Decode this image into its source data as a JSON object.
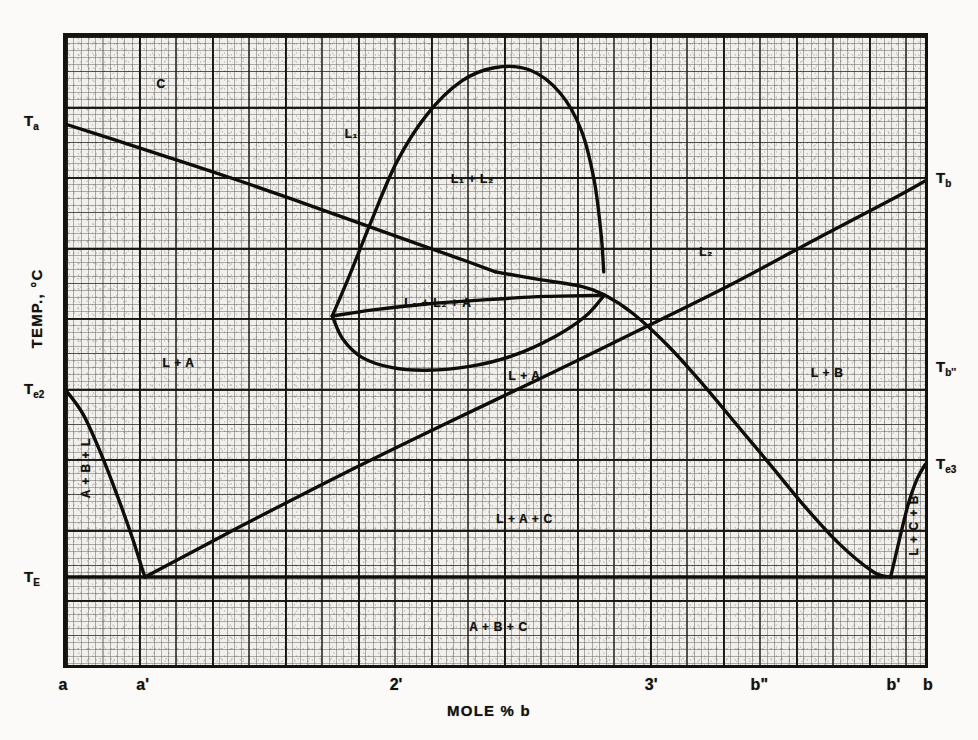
{
  "figure": {
    "kind": "ternary-quasi-binary-phase-diagram",
    "xaxis_title": "MOLE % b",
    "yaxis_title": "TEMP., °C"
  },
  "chart_data": {
    "type": "line",
    "title": "",
    "xlabel": "MOLE % b",
    "ylabel": "TEMP., °C",
    "xlim": [
      0,
      100
    ],
    "ylim": [
      0,
      100
    ],
    "grid": true,
    "legend": "none",
    "x_ticks": [
      {
        "label": "a",
        "x": 0
      },
      {
        "label": "a'",
        "x": 9.2
      },
      {
        "label": "2'",
        "x": 38.5
      },
      {
        "label": "3'",
        "x": 68.0
      },
      {
        "label": "b\"",
        "x": 80.5
      },
      {
        "label": "b'",
        "x": 96.0
      },
      {
        "label": "b",
        "x": 100
      }
    ],
    "y_ticks": [
      {
        "label": "T",
        "sub": "a",
        "y": 86.0,
        "side": "left"
      },
      {
        "label": "T",
        "sub": "e2",
        "y": 43.8,
        "side": "left"
      },
      {
        "label": "T",
        "sub": "E",
        "y": 14.2,
        "side": "left"
      },
      {
        "label": "T",
        "sub": "b",
        "y": 77.0,
        "side": "right"
      },
      {
        "label": "T",
        "sub": "b''",
        "y": 47.3,
        "side": "right"
      },
      {
        "label": "T",
        "sub": "e3",
        "y": 32.0,
        "side": "right"
      }
    ],
    "series": [
      {
        "name": "a-liquidus (A saturation, falling from Ta)",
        "points": [
          [
            0,
            86.0
          ],
          [
            8,
            82.5
          ],
          [
            17,
            78.5
          ],
          [
            26,
            74.3
          ],
          [
            34,
            70.4
          ],
          [
            41,
            67.0
          ],
          [
            46,
            64.6
          ],
          [
            50,
            62.6
          ]
        ]
      },
      {
        "name": "miscibility-gap dome (L1 + L2)",
        "points": [
          [
            31,
            55.6
          ],
          [
            33,
            62.0
          ],
          [
            35.5,
            70.5
          ],
          [
            38.5,
            80.0
          ],
          [
            42,
            87.5
          ],
          [
            46,
            92.8
          ],
          [
            50,
            95.0
          ],
          [
            54,
            94.6
          ],
          [
            57.5,
            91.0
          ],
          [
            60,
            85.0
          ],
          [
            61.5,
            77.0
          ],
          [
            62.3,
            68.5
          ],
          [
            62.6,
            62.6
          ]
        ]
      },
      {
        "name": "three-phase loop lower boundary (L1+L2+A)",
        "points": [
          [
            31,
            55.6
          ],
          [
            32.2,
            52.0
          ],
          [
            34.5,
            49.0
          ],
          [
            38,
            47.4
          ],
          [
            42,
            47.0
          ],
          [
            47,
            47.6
          ],
          [
            52,
            49.3
          ],
          [
            57,
            52.4
          ],
          [
            60.5,
            55.6
          ],
          [
            62.6,
            58.8
          ]
        ]
      },
      {
        "name": "monotectic-type tie line (upper loop chord)",
        "points": [
          [
            31,
            55.6
          ],
          [
            36,
            56.6
          ],
          [
            42,
            57.5
          ],
          [
            49,
            58.2
          ],
          [
            56,
            58.7
          ],
          [
            62.6,
            58.9
          ]
        ]
      },
      {
        "name": "L2 liquidus descending (B saturation branch)",
        "points": [
          [
            50,
            62.6
          ],
          [
            55,
            61.4
          ],
          [
            60,
            60.3
          ],
          [
            62.6,
            59.0
          ],
          [
            66,
            56.0
          ],
          [
            70,
            51.0
          ],
          [
            74,
            45.0
          ],
          [
            78,
            38.5
          ],
          [
            82,
            32.0
          ],
          [
            86,
            25.4
          ],
          [
            90,
            19.5
          ],
          [
            94,
            15.0
          ],
          [
            96,
            14.2
          ]
        ]
      },
      {
        "name": "b-liquidus rising to Tb",
        "points": [
          [
            9.2,
            14.2
          ],
          [
            20,
            22.0
          ],
          [
            32,
            30.4
          ],
          [
            44,
            38.4
          ],
          [
            56,
            46.2
          ],
          [
            68,
            54.2
          ],
          [
            78,
            61.0
          ],
          [
            88,
            68.3
          ],
          [
            96,
            74.0
          ],
          [
            100,
            77.0
          ]
        ]
      },
      {
        "name": "A-rich solidus branch from Te2 down to eutectic a'",
        "points": [
          [
            0,
            43.8
          ],
          [
            2.0,
            40.0
          ],
          [
            4.0,
            34.0
          ],
          [
            6.0,
            27.0
          ],
          [
            7.7,
            20.5
          ],
          [
            8.8,
            15.8
          ],
          [
            9.2,
            14.2
          ]
        ]
      },
      {
        "name": "B-rich branch from eutectic b' up to Te3",
        "points": [
          [
            96,
            14.2
          ],
          [
            97.0,
            20.0
          ],
          [
            98.0,
            25.5
          ],
          [
            99.0,
            29.5
          ],
          [
            100,
            32.0
          ]
        ]
      },
      {
        "name": "eutectic horizontal TE",
        "points": [
          [
            0,
            14.2
          ],
          [
            100,
            14.2
          ]
        ]
      }
    ],
    "region_labels": [
      {
        "text": "C",
        "x": 11,
        "y": 92.5,
        "orient": "h"
      },
      {
        "text": "L₁",
        "x": 33,
        "y": 84.5,
        "orient": "h"
      },
      {
        "text": "L₁ + L₂",
        "x": 47,
        "y": 77.5,
        "orient": "h"
      },
      {
        "text": "L₂",
        "x": 74,
        "y": 66.0,
        "orient": "h"
      },
      {
        "text": "L₁ + L₂ + A",
        "x": 43,
        "y": 58.0,
        "orient": "h"
      },
      {
        "text": "L + A",
        "x": 13,
        "y": 48.5,
        "orient": "h"
      },
      {
        "text": "L + A",
        "x": 53,
        "y": 46.5,
        "orient": "h"
      },
      {
        "text": "L + B",
        "x": 88,
        "y": 47.0,
        "orient": "h"
      },
      {
        "text": "L + A + C",
        "x": 53,
        "y": 24.0,
        "orient": "h"
      },
      {
        "text": "A + B + C",
        "x": 50,
        "y": 7.0,
        "orient": "h"
      },
      {
        "text": "A + B + L",
        "x": 2.3,
        "y": 32.0,
        "orient": "v"
      },
      {
        "text": "L + C + B",
        "x": 98.0,
        "y": 23.0,
        "orient": "v"
      }
    ]
  }
}
